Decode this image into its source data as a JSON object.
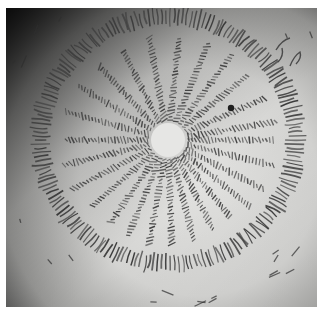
{
  "image": {
    "description": "Grayscale photograph of a handwritten manuscript page with a circular diagram: a ring of script surrounding about twenty radial lines of script emanating from a small blank central circle",
    "border_color": "#ffffff",
    "paper_light": "#e4e4e2",
    "paper_dark": "#1c1c1c",
    "ink_color": "#3a3a3a"
  },
  "diagram": {
    "center": [
      162,
      132
    ],
    "hub_radius": 17,
    "ring_radius_x": 128,
    "ring_radius_y": 124,
    "ring_thickness": 22,
    "radial_line_count": 22,
    "radial_angles_deg": [
      0,
      14,
      28,
      40,
      52,
      64,
      76,
      88,
      100,
      112,
      124,
      138,
      152,
      166,
      180,
      196,
      212,
      228,
      244,
      260,
      276,
      292,
      306,
      320,
      336,
      350
    ],
    "ink_dot": [
      225,
      100
    ]
  }
}
